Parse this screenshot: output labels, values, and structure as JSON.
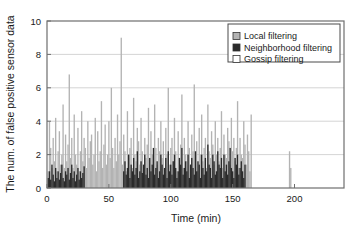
{
  "chart_data": {
    "type": "bar",
    "title": "",
    "xlabel": "Time (min)",
    "ylabel": "The num. of false positive sensor data",
    "xlim": [
      0,
      240
    ],
    "ylim": [
      0,
      10
    ],
    "xticks": [
      0,
      50,
      100,
      150,
      200
    ],
    "yticks": [
      0,
      2,
      4,
      6,
      8,
      10
    ],
    "xtick_labels": [
      "0",
      "50",
      "100",
      "150",
      "200"
    ],
    "ytick_labels": [
      "0",
      "2",
      "4",
      "6",
      "8",
      "10"
    ],
    "grid": "horizontal",
    "legend_position": "top-right",
    "colors": {
      "local": "#b3b3b3",
      "neighborhood": "#2b2b2b",
      "gossip": "#ffffff",
      "axis": "#6e6e6e",
      "grid": "#c9c9c9",
      "text": "#1a1a1a"
    },
    "series": [
      {
        "name": "Local filtering",
        "swatch": "#b3b3b3",
        "x": [
          1,
          2,
          3,
          4,
          5,
          6,
          7,
          8,
          9,
          10,
          11,
          12,
          13,
          14,
          15,
          16,
          17,
          18,
          19,
          20,
          21,
          22,
          23,
          24,
          25,
          26,
          27,
          28,
          29,
          30,
          31,
          32,
          33,
          34,
          35,
          36,
          37,
          38,
          39,
          40,
          41,
          42,
          43,
          44,
          45,
          46,
          47,
          48,
          49,
          50,
          51,
          52,
          53,
          54,
          55,
          56,
          57,
          58,
          59,
          60,
          61,
          62,
          63,
          64,
          65,
          66,
          67,
          68,
          69,
          70,
          71,
          72,
          73,
          74,
          75,
          76,
          77,
          78,
          79,
          80,
          81,
          82,
          83,
          84,
          85,
          86,
          87,
          88,
          89,
          90,
          91,
          92,
          93,
          94,
          95,
          96,
          97,
          98,
          99,
          100,
          101,
          102,
          103,
          104,
          105,
          106,
          107,
          108,
          109,
          110,
          111,
          112,
          113,
          114,
          115,
          116,
          117,
          118,
          119,
          120,
          121,
          122,
          123,
          124,
          125,
          126,
          127,
          128,
          129,
          130,
          131,
          132,
          133,
          134,
          135,
          136,
          137,
          138,
          139,
          140,
          141,
          142,
          143,
          144,
          145,
          146,
          147,
          148,
          149,
          150,
          151,
          152,
          153,
          154,
          155,
          156,
          157,
          158,
          159,
          160,
          161,
          162,
          163,
          164,
          165,
          196,
          197
        ],
        "values": [
          1.0,
          4.0,
          2.4,
          1.2,
          3.0,
          1.6,
          4.2,
          1.0,
          2.2,
          3.4,
          1.4,
          2.0,
          5.0,
          1.2,
          3.2,
          1.6,
          2.6,
          6.8,
          1.8,
          3.0,
          1.2,
          4.4,
          2.0,
          1.4,
          3.6,
          1.0,
          2.2,
          4.6,
          1.6,
          3.0,
          2.4,
          1.2,
          4.0,
          1.8,
          2.8,
          3.2,
          1.4,
          2.0,
          4.2,
          1.0,
          3.4,
          1.6,
          2.2,
          5.2,
          1.2,
          2.6,
          3.8,
          1.4,
          2.0,
          4.0,
          1.8,
          6.0,
          2.4,
          1.2,
          3.0,
          1.6,
          4.4,
          2.0,
          2.8,
          9.0,
          1.4,
          3.2,
          2.2,
          1.0,
          4.6,
          1.8,
          2.4,
          3.0,
          1.2,
          5.4,
          2.0,
          1.6,
          3.6,
          2.8,
          1.4,
          4.2,
          2.2,
          1.0,
          3.0,
          1.8,
          2.6,
          4.8,
          1.2,
          3.4,
          2.0,
          1.6,
          5.0,
          2.4,
          1.4,
          3.0,
          2.2,
          4.0,
          1.8,
          2.8,
          1.2,
          3.6,
          2.0,
          6.0,
          1.4,
          2.4,
          3.0,
          1.6,
          4.2,
          2.2,
          1.0,
          3.4,
          1.8,
          2.6,
          5.6,
          1.2,
          3.0,
          2.0,
          1.6,
          4.0,
          2.4,
          1.4,
          3.2,
          2.2,
          6.2,
          1.8,
          2.8,
          1.0,
          3.6,
          2.0,
          4.4,
          1.6,
          2.4,
          3.0,
          1.2,
          5.0,
          2.2,
          1.8,
          3.4,
          2.6,
          1.4,
          4.0,
          2.0,
          3.0,
          1.6,
          2.4,
          4.6,
          1.2,
          3.2,
          2.0,
          1.8,
          3.6,
          2.8,
          1.4,
          4.2,
          2.2,
          3.0,
          1.6,
          2.4,
          5.2,
          1.2,
          3.0,
          2.0,
          1.8,
          4.0,
          2.6,
          1.4,
          3.2,
          2.2,
          1.0,
          4.4,
          2.2,
          1.2
        ]
      },
      {
        "name": "Neighborhood filtering",
        "swatch": "#2b2b2b",
        "x": [
          1,
          2,
          3,
          4,
          5,
          6,
          7,
          8,
          9,
          10,
          11,
          12,
          13,
          14,
          15,
          16,
          17,
          18,
          19,
          20,
          21,
          22,
          23,
          24,
          25,
          26,
          27,
          28,
          29,
          30,
          62,
          63,
          64,
          65,
          66,
          67,
          68,
          69,
          70,
          71,
          72,
          73,
          74,
          75,
          76,
          77,
          78,
          79,
          80,
          81,
          82,
          83,
          84,
          85,
          86,
          87,
          88,
          89,
          90,
          91,
          92,
          93,
          94,
          95,
          96,
          97,
          98,
          99,
          100,
          101,
          102,
          103,
          104,
          105,
          106,
          107,
          108,
          109,
          110,
          111,
          112,
          113,
          114,
          115,
          116,
          117,
          118,
          119,
          120,
          121,
          122,
          123,
          124,
          125,
          126,
          127,
          128,
          129,
          130,
          131,
          132,
          133,
          134,
          135,
          136,
          137,
          138,
          139,
          140,
          141,
          142,
          143,
          144,
          145,
          146,
          147,
          148,
          149,
          150,
          151,
          152,
          153,
          154,
          155,
          156,
          157,
          158,
          159,
          160
        ],
        "values": [
          0.6,
          1.0,
          0.5,
          1.4,
          0.8,
          0.4,
          1.2,
          0.6,
          1.0,
          0.5,
          0.9,
          1.4,
          0.6,
          0.4,
          1.0,
          0.8,
          1.2,
          0.5,
          0.9,
          1.4,
          0.6,
          1.0,
          0.4,
          0.8,
          1.2,
          0.5,
          1.0,
          0.6,
          0.9,
          1.3,
          1.0,
          1.6,
          0.8,
          1.2,
          2.0,
          0.6,
          1.4,
          1.0,
          1.8,
          0.8,
          1.2,
          2.2,
          0.6,
          1.0,
          1.6,
          0.9,
          1.4,
          2.0,
          0.8,
          1.2,
          0.6,
          1.8,
          1.0,
          1.4,
          2.4,
          0.8,
          1.2,
          1.6,
          0.6,
          1.0,
          2.0,
          1.4,
          0.8,
          1.2,
          1.8,
          0.6,
          2.2,
          1.0,
          1.4,
          0.8,
          1.6,
          2.0,
          1.2,
          0.6,
          1.0,
          1.8,
          1.4,
          2.4,
          0.8,
          1.2,
          1.6,
          1.0,
          2.0,
          0.6,
          1.4,
          1.8,
          1.2,
          0.8,
          2.2,
          1.0,
          1.6,
          1.4,
          0.6,
          2.0,
          1.2,
          0.8,
          1.8,
          1.0,
          2.6,
          1.4,
          1.2,
          0.6,
          2.0,
          1.6,
          0.8,
          1.0,
          2.2,
          1.4,
          1.2,
          1.8,
          0.6,
          2.0,
          1.0,
          1.4,
          0.8,
          1.6,
          2.4,
          1.2,
          1.0,
          0.6,
          1.8,
          1.4,
          2.0,
          0.8,
          1.2,
          1.6,
          1.0,
          0.6,
          1.4
        ]
      },
      {
        "name": "Gossip filtering",
        "swatch": "#ffffff",
        "x": [],
        "values": []
      }
    ]
  }
}
